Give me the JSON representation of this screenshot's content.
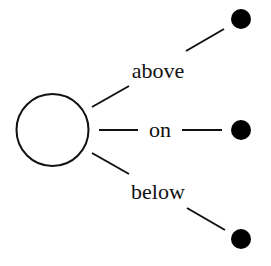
{
  "diagram": {
    "type": "relation-tree",
    "source_node": {
      "shape": "open-circle",
      "cx": 52.5,
      "cy": 130,
      "r": 36
    },
    "edges": [
      {
        "label": "above",
        "target": {
          "shape": "filled-dot",
          "cx": 241,
          "cy": 19,
          "r": 10
        }
      },
      {
        "label": "on",
        "target": {
          "shape": "filled-dot",
          "cx": 241,
          "cy": 130,
          "r": 10
        }
      },
      {
        "label": "below",
        "target": {
          "shape": "filled-dot",
          "cx": 241,
          "cy": 239,
          "r": 10
        }
      }
    ],
    "colors": {
      "stroke": "#111111",
      "fill": "#000000",
      "background": "#ffffff"
    }
  }
}
